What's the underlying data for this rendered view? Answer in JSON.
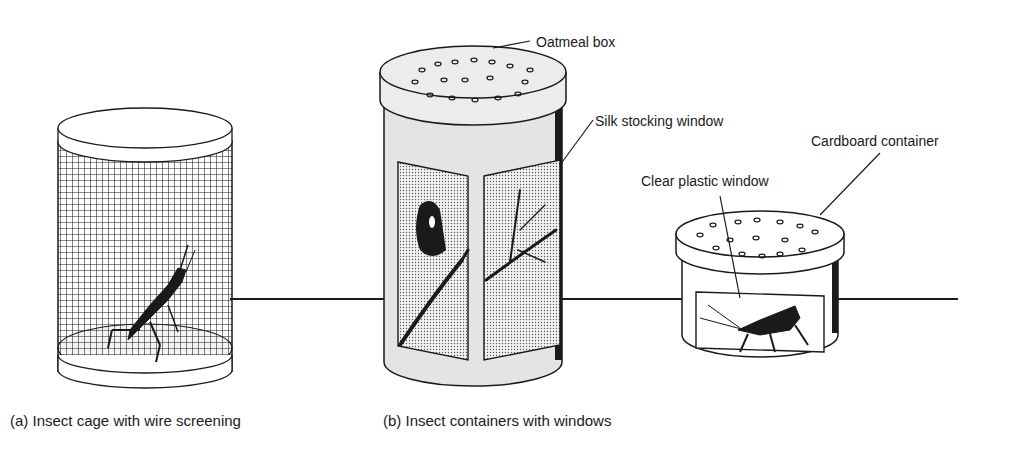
{
  "figure": {
    "panels": [
      {
        "id": "a",
        "caption": "(a) Insect cage with wire screening",
        "subject": "grasshopper"
      },
      {
        "id": "b",
        "caption": "(b) Insect containers with windows",
        "subjects": [
          "butterfly on branch",
          "grasshopper"
        ]
      }
    ],
    "callouts": {
      "oatmeal_box": "Oatmeal box",
      "silk_window": "Silk stocking window",
      "cardboard": "Cardboard container",
      "plastic_window": "Clear plastic window"
    },
    "colors": {
      "ink": "#1a1a1a",
      "paper": "#ffffff",
      "body_gray": "#e4e4e4",
      "lid_gray": "#ececec",
      "stipple": "#d0d0d0"
    }
  }
}
